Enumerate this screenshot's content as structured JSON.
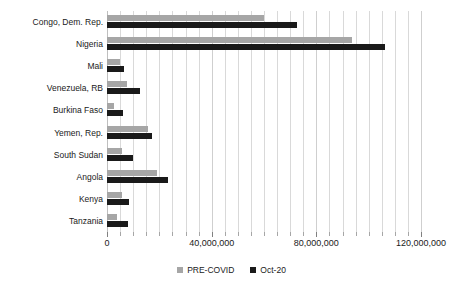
{
  "chart_data": {
    "type": "bar",
    "orientation": "horizontal",
    "title": "",
    "xlabel": "",
    "ylabel": "",
    "xlim": [
      0,
      120000000
    ],
    "grid": true,
    "minor_gridlines": true,
    "legend_position": "bottom",
    "categories": [
      "Congo, Dem. Rep.",
      "Nigeria",
      "Mali",
      "Venezuela, RB",
      "Burkina Faso",
      "Yemen, Rep.",
      "South Sudan",
      "Angola",
      "Kenya",
      "Tanzania"
    ],
    "series": [
      {
        "name": "PRE-COVID",
        "color": "#a6a6a6",
        "values": [
          60000000,
          93600000,
          5000000,
          7600000,
          2700000,
          15700000,
          5700000,
          19100000,
          5700000,
          3800000
        ]
      },
      {
        "name": "Oct-20",
        "color": "#1a1a1a",
        "values": [
          72600000,
          106200000,
          6500000,
          12600000,
          6100000,
          17200000,
          9900000,
          23300000,
          8400000,
          8000000
        ]
      }
    ],
    "xticks": [
      0,
      40000000,
      80000000,
      120000000
    ],
    "xtick_labels": [
      "0",
      "40,000,000",
      "80,000,000",
      "120,000,000"
    ],
    "minor_tick_step": 5000000
  },
  "legend": {
    "items": [
      {
        "label": "PRE-COVID",
        "color": "#a6a6a6"
      },
      {
        "label": "Oct-20",
        "color": "#1a1a1a"
      }
    ]
  },
  "colors": {
    "pre_covid": "#a6a6a6",
    "oct_20": "#1a1a1a",
    "gridline": "#d9d9d9",
    "background": "#ffffff",
    "text": "#1a1a1a"
  }
}
